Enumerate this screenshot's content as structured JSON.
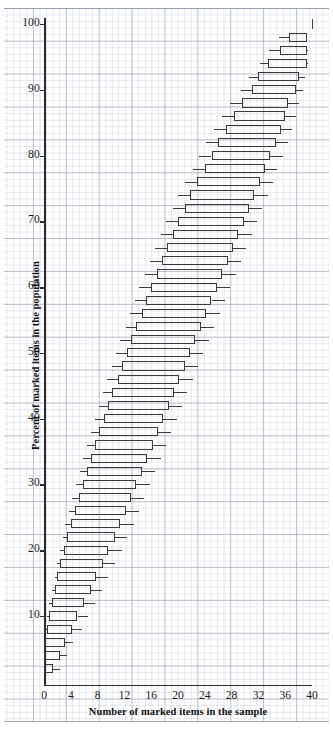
{
  "figure": {
    "xlabel": "Number of marked items in the sample",
    "ylabel": "Percent of marked items in the population",
    "background": "graph-paper",
    "grid_color": "#96a0af"
  },
  "chart_data": {
    "type": "bar",
    "subtype": "horizontal-box-whisker-confidence-belt",
    "title": "",
    "xlabel": "Number of marked items in the sample",
    "ylabel": "Percent of marked items in the population",
    "xlim": [
      0,
      40
    ],
    "ylim": [
      0,
      100
    ],
    "xticks": [
      0,
      4,
      8,
      12,
      16,
      20,
      24,
      28,
      32,
      36,
      40
    ],
    "yticks": [
      10,
      20,
      30,
      40,
      50,
      60,
      70,
      80,
      90,
      100
    ],
    "xtick_labels": [
      "0",
      "4",
      "8",
      "12",
      "16",
      "20",
      "24",
      "28",
      "32",
      "36",
      "40"
    ],
    "ytick_labels": [
      "10",
      "20",
      "30",
      "40",
      "50",
      "60",
      "70",
      "80",
      "90",
      "100"
    ],
    "grid": true,
    "legend": null,
    "series_note": "Each row is a horizontal interval at a population percent (y), spanning sample counts (x): whisker-low, box-low, box-high, whisker-high.",
    "categories": [
      100,
      98,
      96,
      94,
      92,
      90,
      88,
      86,
      84,
      82,
      80,
      78,
      76,
      74,
      72,
      70,
      68,
      66,
      64,
      62,
      60,
      58,
      56,
      54,
      52,
      50,
      48,
      46,
      44,
      42,
      40,
      38,
      36,
      34,
      32,
      30,
      28,
      26,
      24,
      22,
      20,
      18,
      16,
      14,
      12,
      10,
      8,
      6,
      4,
      2
    ],
    "rows": [
      {
        "y": 100,
        "wlo": 40.0,
        "blo": 40.0,
        "bhi": 40.0,
        "whi": 40.0
      },
      {
        "y": 98,
        "wlo": 35.0,
        "blo": 36.6,
        "bhi": 39.2,
        "whi": 39.2
      },
      {
        "y": 96,
        "wlo": 33.6,
        "blo": 35.2,
        "bhi": 39.2,
        "whi": 39.4
      },
      {
        "y": 94,
        "wlo": 32.2,
        "blo": 33.4,
        "bhi": 39.2,
        "whi": 39.4
      },
      {
        "y": 92,
        "wlo": 30.6,
        "blo": 32.0,
        "bhi": 38.0,
        "whi": 39.0
      },
      {
        "y": 90,
        "wlo": 29.4,
        "blo": 31.0,
        "bhi": 37.6,
        "whi": 38.6
      },
      {
        "y": 88,
        "wlo": 27.8,
        "blo": 29.6,
        "bhi": 36.4,
        "whi": 38.0
      },
      {
        "y": 86,
        "wlo": 26.6,
        "blo": 28.4,
        "bhi": 36.0,
        "whi": 37.6
      },
      {
        "y": 84,
        "wlo": 25.4,
        "blo": 27.2,
        "bhi": 35.4,
        "whi": 37.0
      },
      {
        "y": 82,
        "wlo": 24.2,
        "blo": 26.0,
        "bhi": 34.6,
        "whi": 36.4
      },
      {
        "y": 80,
        "wlo": 23.2,
        "blo": 25.0,
        "bhi": 33.8,
        "whi": 35.6
      },
      {
        "y": 78,
        "wlo": 22.2,
        "blo": 24.0,
        "bhi": 33.0,
        "whi": 34.8
      },
      {
        "y": 76,
        "wlo": 21.0,
        "blo": 22.8,
        "bhi": 32.2,
        "whi": 34.2
      },
      {
        "y": 74,
        "wlo": 20.0,
        "blo": 21.8,
        "bhi": 31.4,
        "whi": 33.4
      },
      {
        "y": 72,
        "wlo": 19.2,
        "blo": 21.0,
        "bhi": 30.6,
        "whi": 32.6
      },
      {
        "y": 70,
        "wlo": 18.2,
        "blo": 20.0,
        "bhi": 29.8,
        "whi": 31.8
      },
      {
        "y": 68,
        "wlo": 17.4,
        "blo": 19.2,
        "bhi": 29.0,
        "whi": 31.0
      },
      {
        "y": 66,
        "wlo": 16.6,
        "blo": 18.4,
        "bhi": 28.2,
        "whi": 30.2
      },
      {
        "y": 64,
        "wlo": 15.8,
        "blo": 17.6,
        "bhi": 27.4,
        "whi": 29.4
      },
      {
        "y": 62,
        "wlo": 15.0,
        "blo": 16.8,
        "bhi": 26.6,
        "whi": 28.6
      },
      {
        "y": 60,
        "wlo": 14.2,
        "blo": 16.0,
        "bhi": 25.8,
        "whi": 27.8
      },
      {
        "y": 58,
        "wlo": 13.6,
        "blo": 15.2,
        "bhi": 25.0,
        "whi": 27.0
      },
      {
        "y": 56,
        "wlo": 12.8,
        "blo": 14.6,
        "bhi": 24.2,
        "whi": 26.2
      },
      {
        "y": 54,
        "wlo": 12.2,
        "blo": 13.8,
        "bhi": 23.4,
        "whi": 25.4
      },
      {
        "y": 52,
        "wlo": 11.4,
        "blo": 13.0,
        "bhi": 22.6,
        "whi": 24.6
      },
      {
        "y": 50,
        "wlo": 10.8,
        "blo": 12.4,
        "bhi": 21.8,
        "whi": 23.8
      },
      {
        "y": 48,
        "wlo": 10.2,
        "blo": 11.6,
        "bhi": 21.0,
        "whi": 23.0
      },
      {
        "y": 46,
        "wlo": 9.4,
        "blo": 11.0,
        "bhi": 20.2,
        "whi": 22.2
      },
      {
        "y": 44,
        "wlo": 8.8,
        "blo": 10.2,
        "bhi": 19.4,
        "whi": 21.4
      },
      {
        "y": 42,
        "wlo": 8.2,
        "blo": 9.6,
        "bhi": 18.6,
        "whi": 20.6
      },
      {
        "y": 40,
        "wlo": 7.6,
        "blo": 9.0,
        "bhi": 17.8,
        "whi": 19.8
      },
      {
        "y": 38,
        "wlo": 7.0,
        "blo": 8.2,
        "bhi": 17.0,
        "whi": 19.0
      },
      {
        "y": 36,
        "wlo": 6.4,
        "blo": 7.6,
        "bhi": 16.2,
        "whi": 18.2
      },
      {
        "y": 34,
        "wlo": 5.8,
        "blo": 7.0,
        "bhi": 15.4,
        "whi": 17.4
      },
      {
        "y": 32,
        "wlo": 5.4,
        "blo": 6.4,
        "bhi": 14.6,
        "whi": 16.6
      },
      {
        "y": 30,
        "wlo": 4.8,
        "blo": 5.8,
        "bhi": 13.8,
        "whi": 15.8
      },
      {
        "y": 28,
        "wlo": 4.2,
        "blo": 5.2,
        "bhi": 13.0,
        "whi": 15.0
      },
      {
        "y": 26,
        "wlo": 3.8,
        "blo": 4.6,
        "bhi": 12.2,
        "whi": 14.2
      },
      {
        "y": 24,
        "wlo": 3.2,
        "blo": 4.0,
        "bhi": 11.4,
        "whi": 13.4
      },
      {
        "y": 22,
        "wlo": 2.8,
        "blo": 3.4,
        "bhi": 10.6,
        "whi": 12.4
      },
      {
        "y": 20,
        "wlo": 2.4,
        "blo": 3.0,
        "bhi": 9.6,
        "whi": 11.6
      },
      {
        "y": 18,
        "wlo": 2.0,
        "blo": 2.4,
        "bhi": 8.8,
        "whi": 10.6
      },
      {
        "y": 16,
        "wlo": 1.6,
        "blo": 2.0,
        "bhi": 7.8,
        "whi": 9.6
      },
      {
        "y": 14,
        "wlo": 1.2,
        "blo": 1.6,
        "bhi": 7.0,
        "whi": 8.6
      },
      {
        "y": 12,
        "wlo": 0.8,
        "blo": 1.2,
        "bhi": 6.0,
        "whi": 7.6
      },
      {
        "y": 10,
        "wlo": 0.4,
        "blo": 0.8,
        "bhi": 5.0,
        "whi": 6.6
      },
      {
        "y": 8,
        "wlo": 0.2,
        "blo": 0.4,
        "bhi": 4.2,
        "whi": 5.6
      },
      {
        "y": 6,
        "wlo": 0.0,
        "blo": 0.2,
        "bhi": 3.2,
        "whi": 4.4
      },
      {
        "y": 4,
        "wlo": 0.0,
        "blo": 0.0,
        "bhi": 2.4,
        "whi": 3.4
      },
      {
        "y": 2,
        "wlo": 0.0,
        "blo": 0.0,
        "bhi": 1.4,
        "whi": 2.4
      }
    ]
  }
}
